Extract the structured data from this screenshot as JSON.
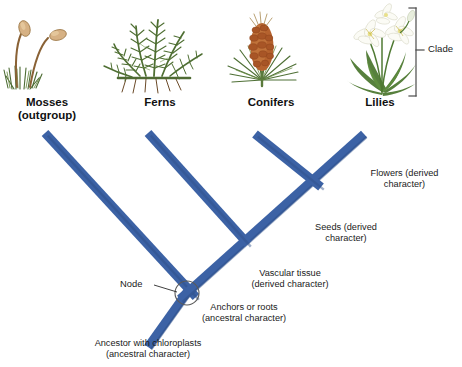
{
  "figure": {
    "type": "phylogenetic-tree",
    "title": "",
    "background_color": "#ffffff",
    "branch_color": "#3c62a5",
    "branch_shade_color": "#2f4f8a",
    "text_color": "#1a1a1a"
  },
  "taxa": [
    {
      "id": "mosses",
      "label": "Mosses",
      "sublabel": "(outgroup)",
      "icon": "moss-plant-illustration",
      "tip_x": 45,
      "tip_y": 133,
      "label_x": 47,
      "label_y": 101
    },
    {
      "id": "ferns",
      "label": "Ferns",
      "sublabel": "",
      "icon": "fern-plant-illustration",
      "tip_x": 148,
      "tip_y": 133,
      "label_x": 160,
      "label_y": 101
    },
    {
      "id": "conifers",
      "label": "Conifers",
      "sublabel": "",
      "icon": "conifer-cone-illustration",
      "tip_x": 255,
      "tip_y": 134,
      "label_x": 271,
      "label_y": 101
    },
    {
      "id": "lilies",
      "label": "Lilies",
      "sublabel": "",
      "icon": "lily-flower-illustration",
      "tip_x": 364,
      "tip_y": 134,
      "label_x": 379,
      "label_y": 101
    }
  ],
  "nodes": [
    {
      "id": "root-node",
      "x": 185,
      "y": 292,
      "label": "Node",
      "circled": true
    },
    {
      "id": "vascular-node",
      "x": 245,
      "y": 240,
      "circled": false
    },
    {
      "id": "seed-node",
      "x": 318,
      "y": 183,
      "circled": false
    }
  ],
  "root": {
    "x": 148,
    "y": 347
  },
  "annotations": [
    {
      "id": "flowers",
      "line1": "Flowers (derived",
      "line2": "character)",
      "x": 360,
      "y": 172,
      "character_type": "derived"
    },
    {
      "id": "seeds",
      "line1": "Seeds (derived",
      "line2": "character)",
      "x": 300,
      "y": 226,
      "character_type": "derived"
    },
    {
      "id": "vascular-tissue",
      "line1": "Vascular tissue",
      "line2": "(derived character)",
      "x": 240,
      "y": 272,
      "character_type": "derived"
    },
    {
      "id": "anchors-or-roots",
      "line1": "Anchors or roots",
      "line2": "(ancestral character)",
      "x": 190,
      "y": 305,
      "character_type": "ancestral"
    },
    {
      "id": "ancestor-with-chloroplasts",
      "line1": "Ancestor with chloroplasts",
      "line2": "(ancestral character)",
      "x": 78,
      "y": 341,
      "character_type": "ancestral"
    }
  ],
  "node_callout": {
    "label": "Node",
    "label_x": 122,
    "label_y": 282,
    "leader_from_x": 152,
    "leader_from_y": 288,
    "leader_to_x": 178,
    "leader_to_y": 294,
    "circle_x": 187,
    "circle_y": 293,
    "circle_r": 12
  },
  "clade": {
    "label": "Clade",
    "label_x": 436,
    "label_y": 48,
    "bracket_x": 415,
    "bracket_top": 8,
    "bracket_bottom": 96,
    "tick_x": 425,
    "tick_y": 48
  },
  "icons": {
    "moss": "moss-plant-illustration",
    "fern": "fern-plant-illustration",
    "conifer": "conifer-cone-illustration",
    "lily": "lily-flower-illustration",
    "node_circle": "node-circle-icon",
    "clade_bracket": "clade-bracket-icon"
  }
}
